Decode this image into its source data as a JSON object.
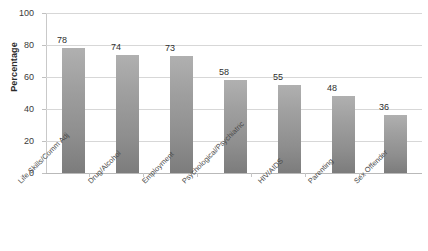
{
  "chart_data": {
    "type": "bar",
    "title": "",
    "subtitle": "",
    "xlabel": "",
    "ylabel": "Percentage",
    "ylim": [
      0,
      100
    ],
    "ytick_step": 20,
    "yticks": [
      "0",
      "20",
      "40",
      "60",
      "80",
      "100"
    ],
    "grid": true,
    "legend": false,
    "legend_position": "none",
    "bar_color": "#a0a0a0",
    "gridline_color": "#d7d7d7",
    "background_color": "#ffffff",
    "text_color": "#3a3a3a",
    "categories": [
      "Life Skills/Comm Adj",
      "Drug/Alcohol",
      "Employment",
      "Psychological/Psychiatric",
      "HIV/AIDS",
      "Parenting",
      "Sex Offender"
    ],
    "values": [
      78,
      74,
      73,
      58,
      55,
      48,
      36
    ],
    "data_labels": [
      "78",
      "74",
      "73",
      "58",
      "55",
      "48",
      "36"
    ]
  }
}
